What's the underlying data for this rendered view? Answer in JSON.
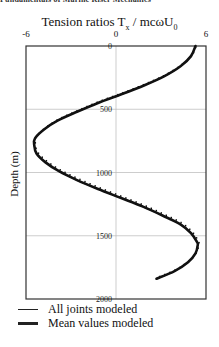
{
  "header": {
    "text": "Fundamentals of Marine Riser Mechanics"
  },
  "chart_data": {
    "type": "line",
    "title_main": "Tension ratios  T",
    "title_sub_x": "x",
    "title_rest": " / mcωU",
    "title_sub_0": "0",
    "xlabel": "Tension ratios T_x / mcωU_0",
    "ylabel": "Depth (m)",
    "x_axis_position": "top",
    "xlim": [
      -6,
      6
    ],
    "ylim": [
      0,
      2000
    ],
    "y_inverted": true,
    "x_ticks": [
      "-6",
      "0",
      "6"
    ],
    "y_ticks": [
      "0",
      "500",
      "1000",
      "1500",
      "2000"
    ],
    "grid": true,
    "legend_position": "bottom",
    "series": [
      {
        "name": "All joints modeled",
        "style": "thin line with joint serrations",
        "points": [
          [
            5.3,
            0
          ],
          [
            5.0,
            80
          ],
          [
            4.3,
            160
          ],
          [
            3.2,
            240
          ],
          [
            1.9,
            310
          ],
          [
            0.4,
            380
          ],
          [
            -1.2,
            450
          ],
          [
            -2.6,
            520
          ],
          [
            -3.9,
            590
          ],
          [
            -4.8,
            660
          ],
          [
            -5.4,
            730
          ],
          [
            -5.45,
            783
          ],
          [
            -5.3,
            850
          ],
          [
            -4.7,
            920
          ],
          [
            -3.8,
            990
          ],
          [
            -2.6,
            1060
          ],
          [
            -1.2,
            1130
          ],
          [
            0.3,
            1200
          ],
          [
            1.8,
            1270
          ],
          [
            3.1,
            1340
          ],
          [
            4.3,
            1410
          ],
          [
            5.0,
            1480
          ],
          [
            5.4,
            1550
          ],
          [
            5.45,
            1573
          ],
          [
            5.3,
            1640
          ],
          [
            4.8,
            1710
          ],
          [
            3.9,
            1780
          ],
          [
            2.7,
            1840
          ]
        ]
      },
      {
        "name": "Mean values modeled",
        "style": "thick line",
        "points": [
          [
            5.3,
            0
          ],
          [
            5.0,
            80
          ],
          [
            4.3,
            160
          ],
          [
            3.2,
            240
          ],
          [
            1.9,
            310
          ],
          [
            0.4,
            380
          ],
          [
            -1.2,
            450
          ],
          [
            -2.6,
            520
          ],
          [
            -3.9,
            590
          ],
          [
            -4.8,
            660
          ],
          [
            -5.4,
            730
          ],
          [
            -5.45,
            783
          ],
          [
            -5.3,
            850
          ],
          [
            -4.7,
            920
          ],
          [
            -3.8,
            990
          ],
          [
            -2.6,
            1060
          ],
          [
            -1.2,
            1130
          ],
          [
            0.3,
            1200
          ],
          [
            1.8,
            1270
          ],
          [
            3.1,
            1340
          ],
          [
            4.3,
            1410
          ],
          [
            5.0,
            1480
          ],
          [
            5.4,
            1550
          ],
          [
            5.45,
            1573
          ],
          [
            5.3,
            1640
          ],
          [
            4.8,
            1710
          ],
          [
            3.9,
            1780
          ],
          [
            2.7,
            1840
          ]
        ]
      }
    ]
  },
  "legend": {
    "items": [
      {
        "label": "All joints modeled",
        "stroke_width": 1.5
      },
      {
        "label": "Mean values modeled",
        "stroke_width": 3
      }
    ]
  },
  "colors": {
    "line": "#111111",
    "grid": "#b8b8b8",
    "frame": "#333333"
  }
}
